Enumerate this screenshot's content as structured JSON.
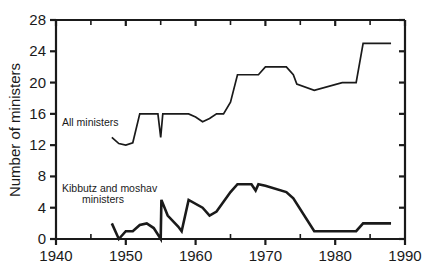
{
  "chart_data": {
    "type": "line",
    "title": "",
    "xlabel": "",
    "ylabel": "Number of ministers",
    "xlim": [
      1940,
      1990
    ],
    "ylim": [
      0,
      28
    ],
    "xticks": [
      1940,
      1950,
      1960,
      1970,
      1980,
      1990
    ],
    "xtick_labels": [
      "1940",
      "1950",
      "1960",
      "1970",
      "1980",
      "1990"
    ],
    "xminorticks": [
      1945,
      1955,
      1965,
      1975,
      1985
    ],
    "yticks": [
      0,
      4,
      8,
      12,
      16,
      20,
      24,
      28
    ],
    "ytick_labels": [
      "0",
      "4",
      "8",
      "12",
      "16",
      "20",
      "24",
      "28"
    ],
    "grid": false,
    "legend_position": "inline-annotations",
    "line_color": "#1a1a1a",
    "series": [
      {
        "name": "All ministers",
        "annotation": "All ministers",
        "x": [
          1948,
          1949,
          1950,
          1951,
          1952,
          1953,
          1954.6,
          1955,
          1955.3,
          1956,
          1959,
          1960,
          1961,
          1962,
          1963,
          1964,
          1965,
          1966,
          1966.6,
          1969,
          1970,
          1973,
          1974,
          1974.5,
          1977,
          1981,
          1983,
          1984,
          1988
        ],
        "y": [
          13,
          12.2,
          12,
          12.3,
          16,
          16,
          16,
          13,
          16,
          16,
          16,
          15.6,
          15,
          15.4,
          16,
          16,
          17.5,
          21,
          21,
          21,
          22,
          22,
          21,
          19.8,
          19,
          20,
          20,
          25,
          25
        ]
      },
      {
        "name": "Kibbutz and moshav ministers",
        "annotation_line1": "Kibbutz and moshav",
        "annotation_line2": "ministers",
        "x": [
          1948,
          1949,
          1950,
          1951,
          1952,
          1953,
          1954,
          1955,
          1955.1,
          1956,
          1957.5,
          1958,
          1959,
          1961,
          1962,
          1963,
          1965,
          1966,
          1968,
          1968.6,
          1969,
          1970,
          1973,
          1974,
          1977,
          1983,
          1984,
          1988
        ],
        "y": [
          2,
          0,
          1,
          1,
          1.8,
          2,
          1.4,
          0,
          5,
          3,
          1.6,
          1,
          5,
          4,
          3,
          3.5,
          6,
          7,
          7,
          6.2,
          7,
          6.8,
          6,
          5.2,
          1,
          1,
          2,
          2
        ]
      }
    ]
  },
  "annotations": {
    "all_ministers": "All ministers",
    "kibbutz_line1": "Kibbutz and moshav",
    "kibbutz_line2": "ministers"
  }
}
